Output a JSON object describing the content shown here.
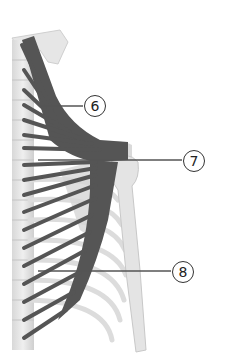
{
  "figure": {
    "colors": {
      "background": "#ffffff",
      "bone": "#e4e4e4",
      "bone_shadow": "#c8c8c8",
      "muscle": "#555555",
      "leader_line": "#555555"
    }
  },
  "labels": [
    {
      "id": "6",
      "text": "6",
      "glyph": "⑥",
      "x": 84,
      "y": 95,
      "line_from": [
        40,
        106
      ],
      "line_to": [
        83,
        106
      ]
    },
    {
      "id": "7",
      "text": "7",
      "glyph": "⑦",
      "x": 183,
      "y": 150,
      "line_from": [
        38,
        160
      ],
      "line_to": [
        182,
        160
      ]
    },
    {
      "id": "8",
      "text": "8",
      "glyph": "⑧",
      "x": 172,
      "y": 261,
      "line_from": [
        38,
        271
      ],
      "line_to": [
        171,
        271
      ]
    }
  ]
}
